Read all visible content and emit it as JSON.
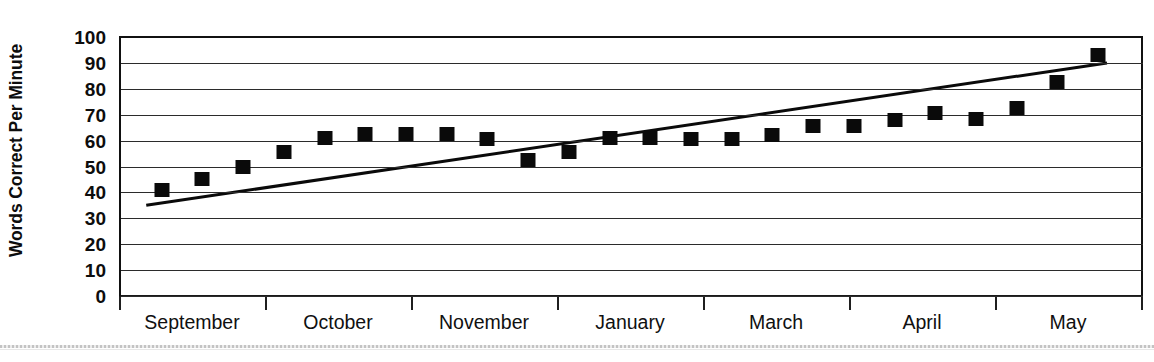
{
  "chart_data": {
    "type": "scatter",
    "title": "",
    "subtitle": "",
    "xlabel": "",
    "ylabel": "Words Correct Per Minute",
    "ylim": [
      0,
      100
    ],
    "y_ticks": [
      100,
      90,
      80,
      70,
      60,
      50,
      40,
      30,
      20,
      10,
      0
    ],
    "grid": true,
    "legend": "none",
    "x_group_labels": [
      "September",
      "October",
      "November",
      "January",
      "March",
      "April",
      "May"
    ],
    "series": [
      {
        "name": "Words Correct Per Minute",
        "marker": "filled-square",
        "color": "#0a0a0a",
        "values": [
          41,
          45,
          50,
          55.5,
          61,
          62.5,
          62.5,
          62.5,
          60.5,
          52.5,
          55.5,
          61,
          61,
          60.5,
          60.5,
          62,
          65.5,
          65.5,
          68,
          70.5,
          68.5,
          72.5,
          82.5,
          93
        ]
      },
      {
        "name": "Trend line",
        "type": "line",
        "color": "#0a0a0a",
        "start_value": 35,
        "end_value": 90
      }
    ]
  },
  "axis": {
    "y_title": "Words Correct Per Minute"
  }
}
